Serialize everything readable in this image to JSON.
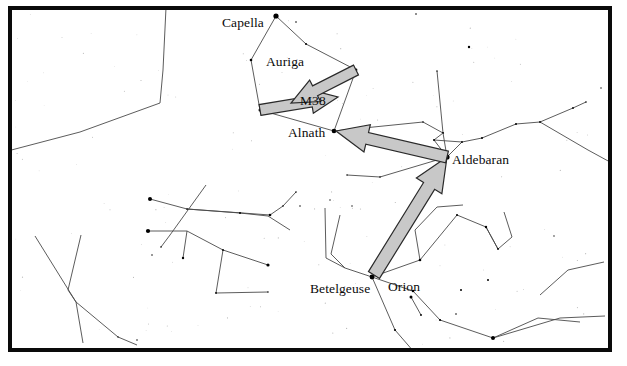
{
  "figure": {
    "type": "star-chart",
    "background_color": "#ffffff",
    "frame_color": "#0a0a0a",
    "frame_width_px": 4,
    "star_color": "#000000",
    "constellation_line_color": "#4a4a4a",
    "arrow_fill_color": "#c8c8c8",
    "arrow_outline_color": "#2a2a2a",
    "label_color": "#0b0b0b"
  },
  "labels": [
    {
      "id": "capella",
      "text": "Capella",
      "x": 222,
      "y": 15,
      "anchor": "start"
    },
    {
      "id": "auriga",
      "text": "Auriga",
      "x": 266,
      "y": 54,
      "anchor": "start"
    },
    {
      "id": "m38",
      "text": "M38",
      "x": 300,
      "y": 93,
      "anchor": "start"
    },
    {
      "id": "alnath",
      "text": "Alnath",
      "x": 288,
      "y": 125,
      "anchor": "start"
    },
    {
      "id": "aldebaran",
      "text": "Aldebaran",
      "x": 452,
      "y": 152,
      "anchor": "start"
    },
    {
      "id": "betelgeuse",
      "text": "Betelgeuse",
      "x": 310,
      "y": 281,
      "anchor": "start"
    },
    {
      "id": "orion",
      "text": "Orion",
      "x": 388,
      "y": 279,
      "anchor": "start"
    }
  ],
  "arrows": [
    {
      "id": "arrow-betelgeuse-to-aldebaran",
      "from_label": "Betelgeuse",
      "to_label": "Aldebaran",
      "from": [
        374,
        275
      ],
      "to": [
        447,
        157
      ],
      "shaft_width": 13,
      "head_width": 30,
      "head_length": 34
    },
    {
      "id": "arrow-aldebaran-to-alnath",
      "from_label": "Aldebaran",
      "to_label": "Alnath",
      "from": [
        447,
        157
      ],
      "to": [
        336,
        131
      ],
      "shaft_width": 12,
      "head_width": 28,
      "head_length": 32
    },
    {
      "id": "arrow-alnath-to-m38",
      "from_label": "Alnath",
      "to_label": "M38",
      "from": [
        260,
        110
      ],
      "to": [
        338,
        97
      ],
      "shaft_width": 11,
      "head_width": 24,
      "head_length": 27
    },
    {
      "id": "arrow-auriga-to-m38",
      "from_label": "Auriga east star",
      "to_label": "M38",
      "from": [
        356,
        70
      ],
      "to": [
        291,
        103
      ],
      "shaft_width": 11,
      "head_width": 24,
      "head_length": 27
    }
  ],
  "named_stars": [
    {
      "name": "Capella",
      "x": 276,
      "y": 16,
      "magnitude_radius": 4.2
    },
    {
      "name": "Alnath",
      "x": 334,
      "y": 131,
      "magnitude_radius": 3.6
    },
    {
      "name": "Aldebaran",
      "x": 447,
      "y": 157,
      "magnitude_radius": 4.2
    },
    {
      "name": "Betelgeuse",
      "x": 372,
      "y": 277,
      "magnitude_radius": 3.8
    }
  ],
  "stars": [
    [
      276,
      16,
      4.2
    ],
    [
      296,
      22,
      1.6
    ],
    [
      251,
      60,
      2.6
    ],
    [
      306,
      44,
      2.0
    ],
    [
      356,
      70,
      2.8
    ],
    [
      260,
      110,
      3.0
    ],
    [
      334,
      131,
      3.6
    ],
    [
      447,
      157,
      4.2
    ],
    [
      443,
      133,
      2.2
    ],
    [
      434,
      140,
      2.0
    ],
    [
      462,
      142,
      1.8
    ],
    [
      482,
      138,
      2.0
    ],
    [
      516,
      124,
      2.0
    ],
    [
      540,
      122,
      1.8
    ],
    [
      573,
      108,
      1.8
    ],
    [
      586,
      102,
      1.6
    ],
    [
      423,
      122,
      1.6
    ],
    [
      469,
      47,
      2.4
    ],
    [
      416,
      14,
      1.6
    ],
    [
      150,
      199,
      4.0
    ],
    [
      148,
      231,
      4.2
    ],
    [
      187,
      209,
      1.7
    ],
    [
      183,
      258,
      2.4
    ],
    [
      240,
      213,
      2.0
    ],
    [
      270,
      215,
      2.6
    ],
    [
      283,
      206,
      1.6
    ],
    [
      296,
      192,
      1.6
    ],
    [
      223,
      250,
      1.8
    ],
    [
      268,
      265,
      3.2
    ],
    [
      216,
      293,
      1.8
    ],
    [
      268,
      292,
      1.5
    ],
    [
      161,
      247,
      1.6
    ],
    [
      152,
      255,
      1.5
    ],
    [
      372,
      277,
      3.8
    ],
    [
      420,
      260,
      2.6
    ],
    [
      413,
      291,
      2.6
    ],
    [
      411,
      297,
      3.0
    ],
    [
      421,
      315,
      1.9
    ],
    [
      461,
      290,
      2.0
    ],
    [
      488,
      280,
      2.0
    ],
    [
      457,
      215,
      2.0
    ],
    [
      486,
      227,
      2.4
    ],
    [
      498,
      249,
      1.8
    ],
    [
      456,
      314,
      1.6
    ],
    [
      493,
      338,
      4.0
    ],
    [
      440,
      320,
      2.2
    ],
    [
      395,
      330,
      2.2
    ],
    [
      300,
      206,
      1.5
    ],
    [
      330,
      200,
      1.4
    ],
    [
      352,
      206,
      1.4
    ],
    [
      118,
      337,
      1.4
    ],
    [
      137,
      340,
      1.5
    ],
    [
      437,
      71,
      1.5
    ],
    [
      601,
      88,
      1.4
    ],
    [
      554,
      236,
      1.3
    ],
    [
      380,
      177,
      1.6
    ],
    [
      347,
      175,
      1.5
    ]
  ],
  "constellation_lines": [
    {
      "group": "auriga-pentagon",
      "points": [
        [
          276,
          16
        ],
        [
          306,
          44
        ],
        [
          356,
          70
        ],
        [
          334,
          131
        ],
        [
          260,
          110
        ],
        [
          251,
          60
        ],
        [
          276,
          16
        ]
      ]
    },
    {
      "group": "taurus-horns",
      "points": [
        [
          334,
          131
        ],
        [
          423,
          122
        ],
        [
          443,
          133
        ],
        [
          447,
          157
        ]
      ]
    },
    {
      "group": "taurus-hyades",
      "points": [
        [
          443,
          133
        ],
        [
          434,
          140
        ],
        [
          447,
          157
        ],
        [
          462,
          142
        ],
        [
          434,
          140
        ]
      ]
    },
    {
      "group": "taurus-chain",
      "points": [
        [
          462,
          142
        ],
        [
          482,
          138
        ],
        [
          516,
          124
        ],
        [
          540,
          122
        ],
        [
          573,
          108
        ],
        [
          586,
          102
        ]
      ]
    },
    {
      "group": "taurus-spur",
      "points": [
        [
          443,
          133
        ],
        [
          437,
          71
        ]
      ]
    },
    {
      "group": "aldebaran-spur",
      "points": [
        [
          447,
          157
        ],
        [
          380,
          177
        ],
        [
          347,
          175
        ]
      ]
    },
    {
      "group": "upper-left-line",
      "points": [
        [
          0,
          153
        ],
        [
          80,
          132
        ],
        [
          160,
          103
        ],
        [
          163,
          70
        ],
        [
          166,
          8
        ]
      ]
    },
    {
      "group": "orion-upper",
      "points": [
        [
          372,
          277
        ],
        [
          420,
          260
        ],
        [
          457,
          215
        ],
        [
          486,
          227
        ],
        [
          498,
          249
        ]
      ]
    },
    {
      "group": "orion-belt",
      "points": [
        [
          372,
          277
        ],
        [
          413,
          291
        ],
        [
          440,
          320
        ],
        [
          493,
          338
        ]
      ]
    },
    {
      "group": "orion-belt2",
      "points": [
        [
          411,
          297
        ],
        [
          421,
          315
        ]
      ]
    },
    {
      "group": "orion-lower",
      "points": [
        [
          493,
          338
        ],
        [
          538,
          318
        ],
        [
          580,
          322
        ]
      ]
    },
    {
      "group": "orion-club",
      "points": [
        [
          420,
          260
        ],
        [
          415,
          230
        ],
        [
          437,
          207
        ],
        [
          463,
          205
        ]
      ]
    },
    {
      "group": "orion-shield",
      "points": [
        [
          372,
          277
        ],
        [
          395,
          330
        ],
        [
          421,
          360
        ]
      ]
    },
    {
      "group": "orion-arm",
      "points": [
        [
          340,
          215
        ],
        [
          331,
          254
        ],
        [
          345,
          268
        ],
        [
          372,
          277
        ]
      ]
    },
    {
      "group": "orion-arm2",
      "points": [
        [
          325,
          208
        ],
        [
          326,
          258
        ],
        [
          345,
          268
        ]
      ]
    },
    {
      "group": "gemini-lower",
      "points": [
        [
          150,
          199
        ],
        [
          187,
          209
        ],
        [
          270,
          215
        ],
        [
          283,
          206
        ],
        [
          296,
          192
        ]
      ]
    },
    {
      "group": "gemini-chain",
      "points": [
        [
          187,
          209
        ],
        [
          240,
          213
        ],
        [
          268,
          216
        ],
        [
          290,
          230
        ]
      ]
    },
    {
      "group": "gemini-left",
      "points": [
        [
          148,
          231
        ],
        [
          187,
          231
        ],
        [
          223,
          250
        ],
        [
          268,
          265
        ]
      ]
    },
    {
      "group": "gemini-drop",
      "points": [
        [
          187,
          231
        ],
        [
          183,
          258
        ]
      ]
    },
    {
      "group": "gemini-cross",
      "points": [
        [
          206,
          185
        ],
        [
          170,
          235
        ],
        [
          161,
          247
        ]
      ]
    },
    {
      "group": "gemini-low-2",
      "points": [
        [
          223,
          250
        ],
        [
          216,
          293
        ],
        [
          268,
          292
        ]
      ]
    },
    {
      "group": "lower-left-v",
      "points": [
        [
          35,
          236
        ],
        [
          76,
          302
        ],
        [
          83,
          343
        ]
      ]
    },
    {
      "group": "lower-left-v2",
      "points": [
        [
          81,
          235
        ],
        [
          68,
          290
        ],
        [
          76,
          302
        ]
      ]
    },
    {
      "group": "lower-left-foot",
      "points": [
        [
          76,
          302
        ],
        [
          118,
          337
        ],
        [
          137,
          345
        ]
      ]
    },
    {
      "group": "right-edge-line",
      "points": [
        [
          540,
          122
        ],
        [
          588,
          150
        ],
        [
          610,
          162
        ]
      ]
    },
    {
      "group": "far-right-low",
      "points": [
        [
          540,
          295
        ],
        [
          568,
          270
        ],
        [
          604,
          262
        ]
      ]
    },
    {
      "group": "mid-right-hook",
      "points": [
        [
          486,
          227
        ],
        [
          498,
          249
        ],
        [
          512,
          237
        ],
        [
          504,
          212
        ]
      ]
    },
    {
      "group": "right-lower-long",
      "points": [
        [
          493,
          338
        ],
        [
          560,
          318
        ],
        [
          605,
          316
        ]
      ]
    }
  ]
}
